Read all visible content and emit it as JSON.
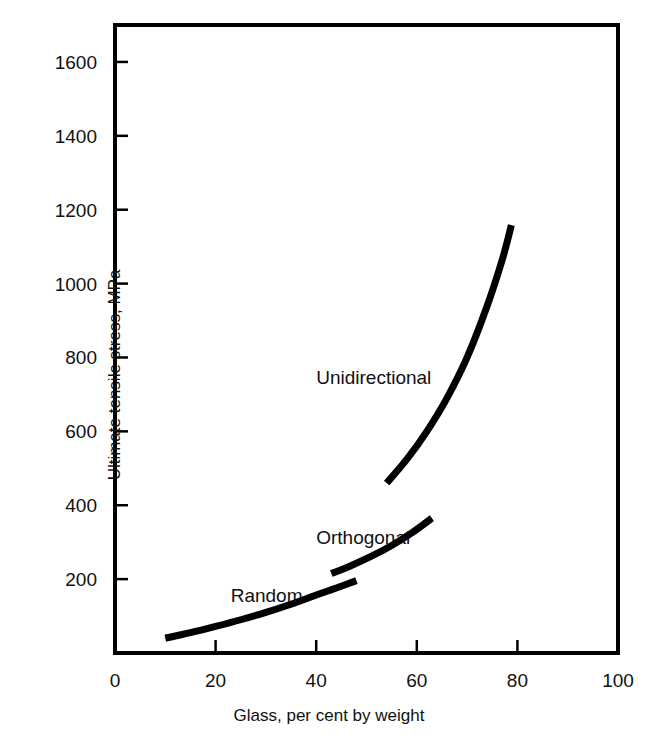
{
  "chart_data": {
    "type": "line",
    "title": "",
    "subtitle": "",
    "xlabel": "Glass, per cent by weight",
    "ylabel": "Ultimate tensile stress, MPa",
    "xlim": [
      0,
      100
    ],
    "ylim": [
      0,
      1700
    ],
    "xticks": [
      0,
      20,
      40,
      60,
      80,
      100
    ],
    "xtick_labels": [
      "0",
      "20",
      "40",
      "60",
      "80",
      "100"
    ],
    "yticks": [
      200,
      400,
      600,
      800,
      1000,
      1200,
      1400,
      1600
    ],
    "ytick_labels": [
      "200",
      "400",
      "600",
      "800",
      "1000",
      "1200",
      "1400",
      "1600"
    ],
    "grid": false,
    "legend": "inline-annotations",
    "legend_position": "inline",
    "line_color": "#000000",
    "line_width_px": 7,
    "frame_color": "#000000",
    "background_color": "#ffffff",
    "series": [
      {
        "name": "Random",
        "label": "Random",
        "label_x": 23,
        "label_y": 155,
        "x": [
          10.0,
          15.0,
          20.0,
          25.0,
          30.0,
          35.0,
          40.0,
          44.0,
          48.0
        ],
        "y": [
          40,
          55,
          72,
          90,
          110,
          132,
          157,
          176,
          196
        ]
      },
      {
        "name": "Orthogonal",
        "label": "Orthogonal",
        "label_x": 40,
        "label_y": 310,
        "x": [
          43.0,
          47.0,
          51.0,
          55.0,
          59.0,
          63.0
        ],
        "y": [
          215,
          237,
          262,
          291,
          325,
          365
        ]
      },
      {
        "name": "Unidirectional",
        "label": "Unidirectional",
        "label_x": 40,
        "label_y": 745,
        "x": [
          54.0,
          58.0,
          62.0,
          66.0,
          70.0,
          74.0,
          77.0,
          78.8
        ],
        "y": [
          460,
          524,
          600,
          690,
          800,
          940,
          1065,
          1158
        ]
      }
    ]
  },
  "plot_geometry": {
    "left_px": 115,
    "right_px": 618,
    "top_px": 25,
    "bottom_px": 653,
    "tick_length_px": 13
  }
}
